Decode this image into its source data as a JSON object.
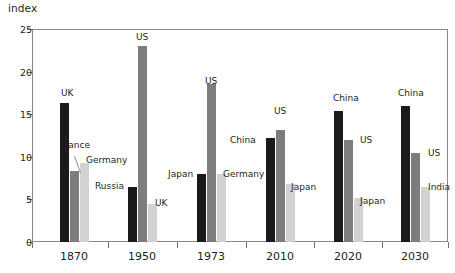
{
  "chart_data": {
    "type": "bar",
    "title": "",
    "subtitle": "",
    "ylabel": "index",
    "xlabel": "",
    "ylim": [
      0,
      25
    ],
    "yticks": [
      0,
      5,
      10,
      15,
      20,
      25
    ],
    "ytick_labels": [
      "0",
      "5",
      "10",
      "15",
      "20",
      "25"
    ],
    "grid": false,
    "legend": "none (direct bar labels)",
    "categories": [
      "1870",
      "1950",
      "1973",
      "2010",
      "2020",
      "2030"
    ],
    "series_colors": {
      "rank1_black": "#1a1a1a",
      "rank2_midgray": "#7d7d7d",
      "rank3_lightgray": "#d2d2d2"
    },
    "groups": [
      {
        "category": "1870",
        "bars": [
          {
            "label": "UK",
            "value": 16.3,
            "shade": "rank1_black"
          },
          {
            "label": "France",
            "value": 8.3,
            "shade": "rank2_midgray"
          },
          {
            "label": "Germany",
            "value": 9.3,
            "shade": "rank3_lightgray"
          }
        ]
      },
      {
        "category": "1950",
        "bars": [
          {
            "label": "Russia",
            "value": 6.5,
            "shade": "rank1_black"
          },
          {
            "label": "US",
            "value": 23.0,
            "shade": "rank2_midgray"
          },
          {
            "label": "UK",
            "value": 4.5,
            "shade": "rank3_lightgray"
          }
        ]
      },
      {
        "category": "1973",
        "bars": [
          {
            "label": "Japan",
            "value": 8.0,
            "shade": "rank1_black"
          },
          {
            "label": "US",
            "value": 18.5,
            "shade": "rank2_midgray"
          },
          {
            "label": "Germany",
            "value": 8.0,
            "shade": "rank3_lightgray"
          }
        ]
      },
      {
        "category": "2010",
        "bars": [
          {
            "label": "China",
            "value": 12.2,
            "shade": "rank1_black"
          },
          {
            "label": "US",
            "value": 13.1,
            "shade": "rank2_midgray"
          },
          {
            "label": "Japan",
            "value": 6.8,
            "shade": "rank3_lightgray"
          }
        ]
      },
      {
        "category": "2020",
        "bars": [
          {
            "label": "China",
            "value": 15.4,
            "shade": "rank1_black"
          },
          {
            "label": "US",
            "value": 12.0,
            "shade": "rank2_midgray"
          },
          {
            "label": "Japan",
            "value": 5.2,
            "shade": "rank3_lightgray"
          }
        ]
      },
      {
        "category": "2030",
        "bars": [
          {
            "label": "China",
            "value": 16.0,
            "shade": "rank1_black"
          },
          {
            "label": "US",
            "value": 10.5,
            "shade": "rank2_midgray"
          },
          {
            "label": "India",
            "value": 6.5,
            "shade": "rank3_lightgray"
          }
        ]
      }
    ],
    "annotations": [
      {
        "text": "UK",
        "group": "1870",
        "placement": "above-bar"
      },
      {
        "text": "France",
        "group": "1870",
        "placement": "leader-line-left"
      },
      {
        "text": "Germany",
        "group": "1870",
        "placement": "right-of-bar"
      },
      {
        "text": "Russia",
        "group": "1950",
        "placement": "left-of-bar"
      },
      {
        "text": "US",
        "group": "1950",
        "placement": "above-bar"
      },
      {
        "text": "UK",
        "group": "1950",
        "placement": "right-of-bar"
      },
      {
        "text": "Japan",
        "group": "1973",
        "placement": "left-of-bar"
      },
      {
        "text": "US",
        "group": "1973",
        "placement": "above-bar"
      },
      {
        "text": "Germany",
        "group": "1973",
        "placement": "right-of-bar"
      },
      {
        "text": "China",
        "group": "2010",
        "placement": "left-of-bar"
      },
      {
        "text": "US",
        "group": "2010",
        "placement": "above-bar"
      },
      {
        "text": "Japan",
        "group": "2010",
        "placement": "right-of-bar"
      },
      {
        "text": "China",
        "group": "2020",
        "placement": "above-bar"
      },
      {
        "text": "US",
        "group": "2020",
        "placement": "right-of-bar"
      },
      {
        "text": "Japan",
        "group": "2020",
        "placement": "right-of-bar"
      },
      {
        "text": "China",
        "group": "2030",
        "placement": "above-bar"
      },
      {
        "text": "US",
        "group": "2030",
        "placement": "right-of-bar"
      },
      {
        "text": "India",
        "group": "2030",
        "placement": "right-of-bar"
      }
    ]
  },
  "layout": {
    "plot": {
      "left": 32,
      "top": 29,
      "width": 416,
      "height": 213
    },
    "group_centers": [
      74,
      142,
      211,
      280,
      348,
      415
    ],
    "bar_width": 9,
    "bar_gap": 1,
    "label_offsets": [
      {
        "group": 0,
        "labels": [
          {
            "text": "UK",
            "x": 61,
            "y": 88,
            "anchor": "left"
          },
          {
            "text": "France",
            "x": 60,
            "y": 140,
            "anchor": "left"
          },
          {
            "text": "Germany",
            "x": 86,
            "y": 155,
            "anchor": "left"
          },
          {
            "leader": true,
            "x1": 74,
            "y1": 156,
            "x2": 80,
            "y2": 173
          }
        ]
      },
      {
        "group": 1,
        "labels": [
          {
            "text": "Russia",
            "x": 95,
            "y": 181,
            "anchor": "left"
          },
          {
            "text": "US",
            "x": 136,
            "y": 32,
            "anchor": "left"
          },
          {
            "text": "UK",
            "x": 155,
            "y": 198,
            "anchor": "left"
          }
        ]
      },
      {
        "group": 2,
        "labels": [
          {
            "text": "Japan",
            "x": 168,
            "y": 169,
            "anchor": "left"
          },
          {
            "text": "US",
            "x": 205,
            "y": 76,
            "anchor": "left"
          },
          {
            "text": "Germany",
            "x": 223,
            "y": 169,
            "anchor": "left"
          }
        ]
      },
      {
        "group": 3,
        "labels": [
          {
            "text": "China",
            "x": 230,
            "y": 135,
            "anchor": "left"
          },
          {
            "text": "US",
            "x": 274,
            "y": 106,
            "anchor": "left"
          },
          {
            "text": "Japan",
            "x": 291,
            "y": 182,
            "anchor": "left"
          }
        ]
      },
      {
        "group": 4,
        "labels": [
          {
            "text": "China",
            "x": 333,
            "y": 93,
            "anchor": "left"
          },
          {
            "text": "US",
            "x": 360,
            "y": 135,
            "anchor": "left"
          },
          {
            "text": "Japan",
            "x": 360,
            "y": 196,
            "anchor": "left"
          }
        ]
      },
      {
        "group": 5,
        "labels": [
          {
            "text": "China",
            "x": 398,
            "y": 88,
            "anchor": "left"
          },
          {
            "text": "US",
            "x": 428,
            "y": 148,
            "anchor": "left"
          },
          {
            "text": "India",
            "x": 428,
            "y": 182,
            "anchor": "left"
          }
        ]
      }
    ]
  }
}
